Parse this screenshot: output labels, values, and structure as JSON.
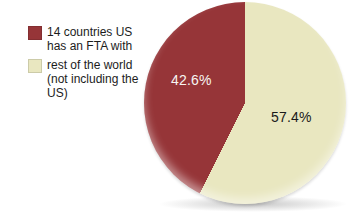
{
  "chart_data": {
    "type": "pie",
    "title": "",
    "labels": [
      "14 countries US has an FTA with",
      "rest of the world (not including the US)"
    ],
    "values": [
      42.6,
      57.4
    ],
    "data_labels": [
      "42.6%",
      "57.4%"
    ],
    "colors": [
      "#963538",
      "#e9e7c0"
    ],
    "data_label_colors": [
      "#f7f5f2",
      "#1a1a1a"
    ],
    "legend_position": "left",
    "start_angle_deg": 0
  },
  "legend": {
    "items": [
      {
        "label": "14 countries US\nhas an FTA with",
        "color": "#963538"
      },
      {
        "label": "rest of the world\n(not including the\nUS)",
        "color": "#e9e7c0"
      }
    ]
  }
}
